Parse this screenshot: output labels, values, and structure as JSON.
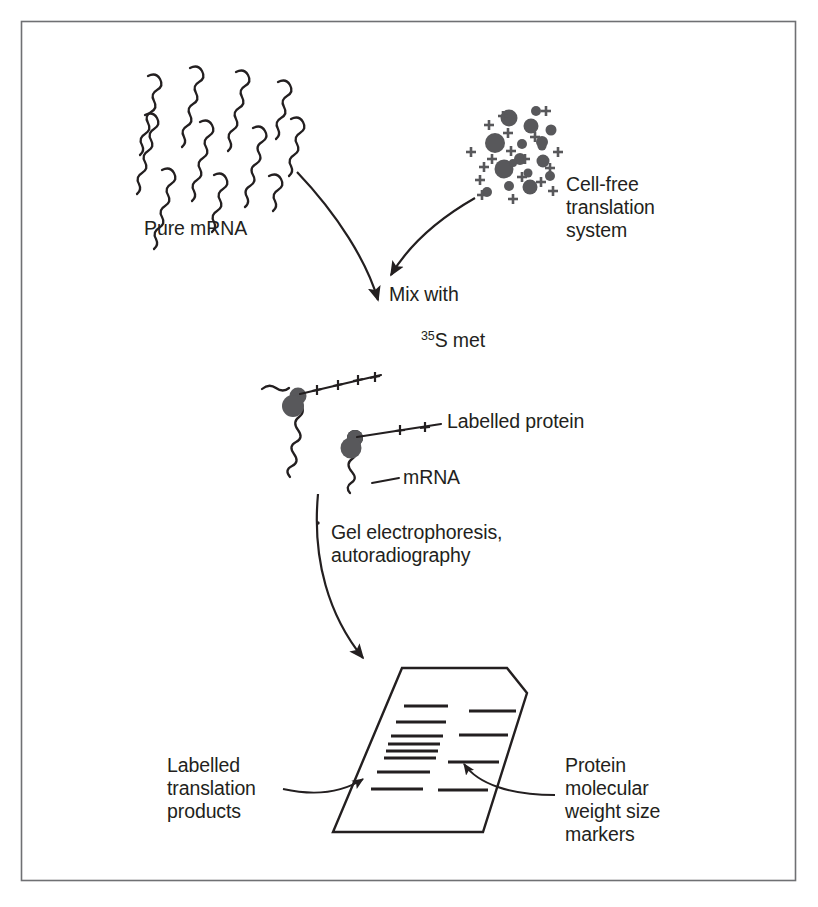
{
  "figure": {
    "border_color": "#6f7073",
    "ink_color": "#231f20",
    "particle_color": "#58585b",
    "background": "#ffffff"
  },
  "labels": {
    "pure_mrna": "Pure mRNA",
    "cell_free_system_line1": "Cell-free",
    "cell_free_system_line2": "translation",
    "cell_free_system_line3": "system",
    "mix_line1": "Mix with",
    "mix_sup": "35",
    "mix_line2_rest": "S met",
    "labelled_protein": "Labelled protein",
    "mrna": "mRNA",
    "gel_step_line1": "Gel electrophoresis,",
    "gel_step_line2": "autoradiography",
    "translation_products_line1": "Labelled",
    "translation_products_line2": "translation",
    "translation_products_line3": "products",
    "markers_line1": "Protein",
    "markers_line2": "molecular",
    "markers_line3": "weight size",
    "markers_line4": "markers"
  },
  "icons": {
    "mrna_strand": "wavy-mrna-strand-icon",
    "ribosome": "ribosome-icon",
    "particle": "particle-dot-icon",
    "plus": "plus-charge-icon",
    "arrow": "curved-arrow-icon",
    "gel": "gel-autoradiograph-icon",
    "band": "gel-band-icon"
  },
  "diagram_data": {
    "type": "diagram",
    "steps": [
      "Pure mRNA",
      "Cell-free translation system",
      "Mix with 35S met",
      "Labelled protein on mRNA",
      "Gel electrophoresis, autoradiography",
      "Autoradiograph with bands"
    ],
    "pure_mrna_strand_count": 11,
    "particle_count": 17,
    "plus_count": 18,
    "ribosome_count": 2,
    "gel_lanes": [
      {
        "name": "Labelled translation products",
        "band_count": 8,
        "bands": [
          {
            "y": 706,
            "x1": 404,
            "x2": 448
          },
          {
            "y": 722,
            "x1": 396,
            "x2": 446
          },
          {
            "y": 736,
            "x1": 391,
            "x2": 443
          },
          {
            "y": 744,
            "x1": 388,
            "x2": 440
          },
          {
            "y": 751,
            "x1": 386,
            "x2": 438
          },
          {
            "y": 758,
            "x1": 384,
            "x2": 436
          },
          {
            "y": 772,
            "x1": 377,
            "x2": 430
          },
          {
            "y": 789,
            "x1": 371,
            "x2": 423
          }
        ]
      },
      {
        "name": "Protein molecular weight size markers",
        "band_count": 4,
        "bands": [
          {
            "y": 711,
            "x1": 469,
            "x2": 516
          },
          {
            "y": 735,
            "x1": 459,
            "x2": 508
          },
          {
            "y": 762,
            "x1": 448,
            "x2": 499
          },
          {
            "y": 790,
            "x1": 438,
            "x2": 488
          }
        ]
      }
    ]
  }
}
